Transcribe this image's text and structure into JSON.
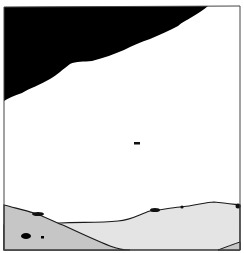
{
  "scene": {
    "description": "Hand-drawn panel illustration: black sky wedge in upper left, white open sky, distant hills and foreground slope in gray",
    "colors": {
      "background": "#ffffff",
      "sky_dark": "#000000",
      "ground_light": "#e6e6e6",
      "ground_dark": "#c8c8c8",
      "outline": "#1a1a1a",
      "border": "#555555"
    }
  }
}
